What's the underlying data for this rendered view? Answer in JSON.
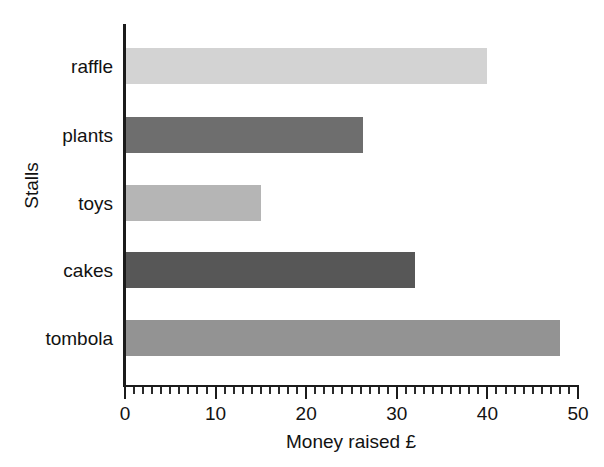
{
  "chart_data": {
    "type": "bar",
    "orientation": "horizontal",
    "title": "",
    "xlabel": "Money raised £",
    "ylabel": "Stalls",
    "categories": [
      "raffle",
      "plants",
      "toys",
      "cakes",
      "tombola"
    ],
    "values": [
      40,
      26.3,
      15,
      32,
      48
    ],
    "xlim": [
      0,
      50
    ],
    "xticks": [
      0,
      10,
      20,
      30,
      40,
      50
    ],
    "xtick_labels": [
      "0",
      "10",
      "20",
      "30",
      "40",
      "50"
    ],
    "minor_tick_interval": 1,
    "grid": false,
    "legend": null,
    "bar_colors": [
      "#d3d3d3",
      "#6e6e6e",
      "#b5b5b5",
      "#575757",
      "#939393"
    ],
    "axis_color": "#1b1b1b",
    "background": "#ffffff"
  },
  "axes": {
    "x_title": "Money raised £",
    "y_title": "Stalls"
  },
  "bars": [
    {
      "label": "raffle",
      "value": 40,
      "color": "#d3d3d3"
    },
    {
      "label": "plants",
      "value": 26.3,
      "color": "#6e6e6e"
    },
    {
      "label": "toys",
      "value": 15,
      "color": "#b5b5b5"
    },
    {
      "label": "cakes",
      "value": 32,
      "color": "#575757"
    },
    {
      "label": "tombola",
      "value": 48,
      "color": "#939393"
    }
  ],
  "xticks": [
    {
      "value": 0,
      "label": "0"
    },
    {
      "value": 10,
      "label": "10"
    },
    {
      "value": 20,
      "label": "20"
    },
    {
      "value": 30,
      "label": "30"
    },
    {
      "value": 40,
      "label": "40"
    },
    {
      "value": 50,
      "label": "50"
    }
  ]
}
